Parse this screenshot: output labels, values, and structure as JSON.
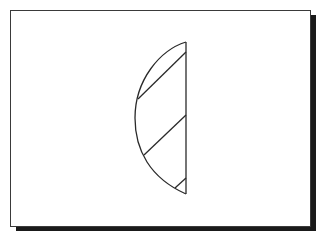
{
  "diagram": {
    "colors": {
      "stroke": "#2a2a2a",
      "frame_border": "#3a3a3a",
      "shadow": "#1a1a1a",
      "background": "#ffffff"
    },
    "shapes": {
      "chord": {
        "x1": 186,
        "y1": 42,
        "x2": 186,
        "y2": 194
      },
      "arc": {
        "start": [
          186,
          42
        ],
        "end": [
          186,
          194
        ],
        "leftmost": [
          135,
          118
        ]
      },
      "diagonals": [
        {
          "x1": 186,
          "y1": 52,
          "x2": 138,
          "y2": 99
        },
        {
          "x1": 186,
          "y1": 115,
          "x2": 144,
          "y2": 155
        },
        {
          "x1": 186,
          "y1": 178,
          "x2": 175,
          "y2": 188
        }
      ]
    }
  }
}
